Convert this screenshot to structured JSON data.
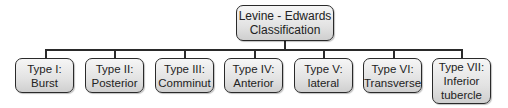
{
  "diagram": {
    "type": "tree",
    "root": {
      "label": "Levine - Edwards\nClassification"
    },
    "children": [
      {
        "id": "type-i",
        "label": "Type I:\nBurst"
      },
      {
        "id": "type-ii",
        "label": "Type II:\nPosterior"
      },
      {
        "id": "type-iii",
        "label": "Type III:\nComminut"
      },
      {
        "id": "type-iv",
        "label": "Type IV:\nAnterior"
      },
      {
        "id": "type-v",
        "label": "Type V:\nlateral"
      },
      {
        "id": "type-vi",
        "label": "Type VI:\nTransverse"
      },
      {
        "id": "type-vii",
        "label": "Type VII:\nInferior\ntubercle"
      }
    ],
    "colors": {
      "border": "#2a2a2a",
      "fill_top": "#f6f6f6",
      "fill_bottom": "#cfcfcf",
      "text": "#222222",
      "background": "#ffffff"
    }
  }
}
